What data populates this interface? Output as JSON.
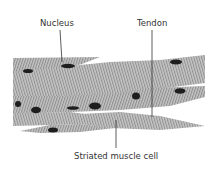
{
  "diagram": {
    "labels": {
      "nucleus": "Nucleus",
      "tendon": "Tendon",
      "cell": "Striated muscle cell"
    },
    "colors": {
      "fiber": "#b8b8b8",
      "stripe": "#8c8c8c",
      "nucleus": "#1e1e1e",
      "leader": "#333333"
    }
  }
}
